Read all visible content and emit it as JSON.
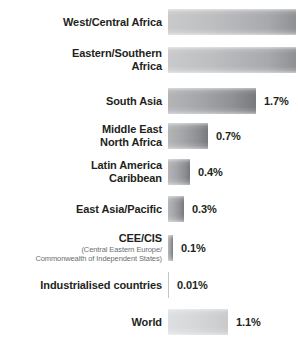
{
  "chart_data": {
    "type": "bar",
    "orientation": "horizontal",
    "title": "",
    "xlabel": "",
    "ylabel": "",
    "unit": "%",
    "grid": false,
    "legend": null,
    "background_color": "#ffffff",
    "label_color": "#231f20",
    "bar_color_light": "#c9cacb",
    "bar_color_dark": "#8e9093",
    "bar_color_world": "#d6d7d9",
    "categories": [
      "West/Central Africa",
      "Eastern/Southern Africa",
      "South Asia",
      "Middle East North Africa",
      "Latin America Caribbean",
      "East Asia/Pacific",
      "CEE/CIS",
      "Industrialised countries",
      "World"
    ],
    "values": [
      null,
      null,
      1.7,
      0.7,
      0.4,
      0.3,
      0.1,
      0.01,
      1.1
    ],
    "value_labels": [
      "",
      "",
      "1.7%",
      "0.7%",
      "0.4%",
      "0.3%",
      "0.1%",
      "0.01%",
      "1.1%"
    ]
  },
  "rows": [
    {
      "name": "west-central-africa",
      "label": "West/Central Africa",
      "sublabel": "",
      "value_label": "",
      "bar_width": 128,
      "bar_style": "",
      "top": 9
    },
    {
      "name": "eastern-southern-africa",
      "label": "Eastern/Southern\nAfrica",
      "sublabel": "",
      "value_label": "",
      "bar_width": 128,
      "bar_style": "",
      "top": 47
    },
    {
      "name": "south-asia",
      "label": "South Asia",
      "sublabel": "",
      "value_label": "1.7%",
      "bar_width": 88,
      "bar_style": "dark",
      "top": 88
    },
    {
      "name": "middle-east-north-africa",
      "label": "Middle East\nNorth Africa",
      "sublabel": "",
      "value_label": "0.7%",
      "bar_width": 40,
      "bar_style": "dark",
      "top": 123
    },
    {
      "name": "latin-america-caribbean",
      "label": "Latin America\nCaribbean",
      "sublabel": "",
      "value_label": "0.4%",
      "bar_width": 22,
      "bar_style": "dark",
      "top": 159
    },
    {
      "name": "east-asia-pacific",
      "label": "East Asia/Pacific",
      "sublabel": "",
      "value_label": "0.3%",
      "bar_width": 16,
      "bar_style": "dark",
      "top": 196
    },
    {
      "name": "cee-cis",
      "label": "CEE/CIS",
      "sublabel": "(Central Eastern Europe/\nCommonwealth of Independent States)",
      "value_label": "0.1%",
      "bar_width": 5,
      "bar_style": "dark",
      "top": 232
    },
    {
      "name": "industrialised-countries",
      "label": "Industrialised countries",
      "sublabel": "",
      "value_label": "0.01%",
      "bar_width": 1,
      "bar_style": "hairline",
      "top": 272
    },
    {
      "name": "world",
      "label": "World",
      "sublabel": "",
      "value_label": "1.1%",
      "bar_width": 60,
      "bar_style": "light",
      "top": 309
    }
  ]
}
